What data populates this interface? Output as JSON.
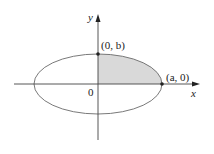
{
  "figure": {
    "type": "ellipse-quadrant-diagram",
    "axes": {
      "x_label": "x",
      "y_label": "y",
      "origin_label": "0"
    },
    "points": [
      {
        "label": "(0, b)",
        "role": "y-intercept"
      },
      {
        "label": "(a, 0)",
        "role": "x-intercept"
      }
    ],
    "shaded_region": "first-quadrant portion of ellipse",
    "colors": {
      "ellipse_stroke": "#6a6a6a",
      "axis_stroke": "#444444",
      "shade_fill": "#d9d9d9",
      "point_fill": "#222222"
    }
  }
}
